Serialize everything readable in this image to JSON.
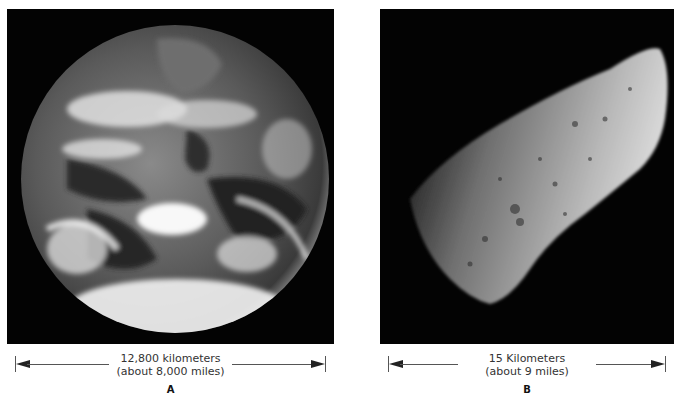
{
  "figures": [
    {
      "id": "A",
      "subject": "Earth",
      "measurement_line1": "12,800 kilometers",
      "measurement_line2": "(about 8,000 miles)",
      "label": "A"
    },
    {
      "id": "B",
      "subject": "asteroid",
      "measurement_line1": "15 Kilometers",
      "measurement_line2": "(about 9 miles)",
      "label": "B"
    }
  ],
  "colors": {
    "background": "#ffffff",
    "panel": "#030303",
    "text": "#333333"
  }
}
